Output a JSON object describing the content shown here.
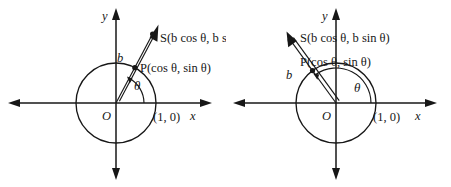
{
  "figure": {
    "background_color": "#ffffff",
    "ink_color": "#171717",
    "panels": [
      {
        "id": "left",
        "name": "acute-angle-panel",
        "axis_x_label": "x",
        "axis_y_label": "y",
        "origin_label": "O",
        "unit_point_label": "(1, 0)",
        "point_p_label": "P(cos θ, sin θ)",
        "point_s_label": "S(b cos θ, b sin θ)",
        "segment_label": "b",
        "angle_label": "θ",
        "angle_degrees": 62,
        "ray_extent_b": 1.95,
        "circle_radius_units": 1
      },
      {
        "id": "right",
        "name": "obtuse-angle-panel",
        "axis_x_label": "x",
        "axis_y_label": "y",
        "origin_label": "O",
        "unit_point_label": "(1, 0)",
        "point_p_label": "P(cos θ, sin θ)",
        "point_s_label": "S(b cos θ, b sin θ)",
        "segment_label": "b",
        "angle_label": "θ",
        "angle_degrees": 126,
        "ray_extent_b": 1.95,
        "circle_radius_units": 1
      }
    ]
  }
}
